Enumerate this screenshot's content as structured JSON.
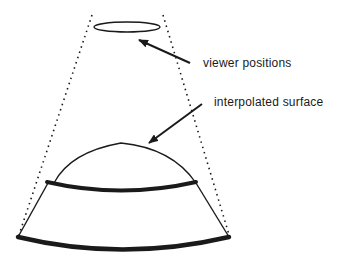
{
  "diagram": {
    "labels": {
      "viewer_positions": "viewer positions",
      "interpolated_surface": "interpolated surface"
    },
    "colors": {
      "ink": "#1a1a1a",
      "background": "#ffffff"
    },
    "elements": [
      "viewer-positions-ellipse",
      "dotted-view-cone-lines",
      "interpolated-surface-dome",
      "upper-thick-band",
      "lower-thick-band",
      "arrow-to-viewer-positions",
      "arrow-to-interpolated-surface"
    ]
  }
}
